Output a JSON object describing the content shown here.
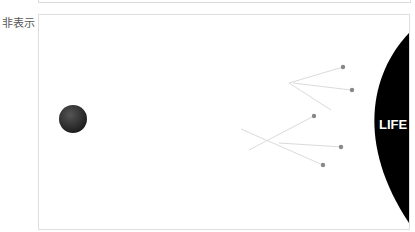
{
  "top_panel": {},
  "hidden_section": {
    "label": "非表示",
    "image": {
      "planet_text": "LIFE",
      "colors": {
        "planet": "#000000",
        "sphere": "#333333",
        "dots": "#888888",
        "lines": "#cfcfcf"
      }
    }
  }
}
